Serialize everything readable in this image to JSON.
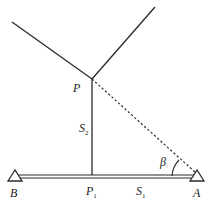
{
  "diagram": {
    "colors": {
      "line": "#2a2a2a",
      "background": "#ffffff"
    },
    "points": {
      "P": {
        "label": "P"
      },
      "P1": {
        "label": "P",
        "subscript": "1"
      },
      "A": {
        "label": "A"
      },
      "B": {
        "label": "B"
      }
    },
    "segments": {
      "S1": {
        "label": "S",
        "subscript": "1"
      },
      "S2": {
        "label": "S",
        "subscript": "2"
      }
    },
    "angle": {
      "label": "β"
    }
  }
}
